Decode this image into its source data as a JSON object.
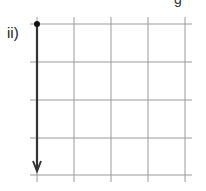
{
  "diagram": {
    "label": "ii)",
    "partial_glyph": "g",
    "grid": {
      "columns": 4,
      "rows": 4,
      "x_lines": [
        37,
        74,
        111,
        148,
        185
      ],
      "y_lines": [
        24,
        62,
        100,
        138,
        175
      ],
      "line_color": "#9a9a9a"
    },
    "vector": {
      "start": [
        37,
        24
      ],
      "end": [
        37,
        171
      ],
      "color": "#333333",
      "description": "Downward arrow of 4 grid units starting from a dot"
    }
  }
}
